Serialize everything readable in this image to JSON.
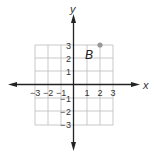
{
  "diagram": {
    "type": "coordinate-plane",
    "axes": {
      "x_label": "x",
      "y_label": "y"
    },
    "x_ticks": [
      "−3",
      "−2",
      "−1",
      "1",
      "2",
      "3"
    ],
    "y_ticks": [
      "3",
      "2",
      "1",
      "1",
      "2",
      "3"
    ],
    "x_range": [
      -3,
      3
    ],
    "y_range": [
      -3,
      3
    ],
    "grid": true,
    "points": [
      {
        "label": "B",
        "x": 2,
        "y": 3,
        "color": "#999999"
      }
    ],
    "colors": {
      "grid": "#bbbbbb",
      "axis": "#222222"
    }
  }
}
